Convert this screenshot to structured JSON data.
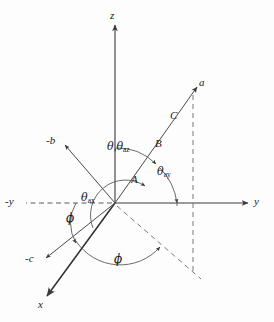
{
  "figure": {
    "type": "vector-direction-angle-diagram",
    "background_color": "#fdfdfd",
    "stroke_color": "#3a3a3a",
    "text_color": "#1a1a1a"
  },
  "axes": [
    {
      "name": "z-axis",
      "label": "z",
      "style": "solid",
      "direction": "up"
    },
    {
      "name": "y-axis",
      "label": "y",
      "style": "solid",
      "direction": "right"
    },
    {
      "name": "x-axis",
      "label": "x",
      "style": "solid",
      "direction": "down-left"
    },
    {
      "name": "negative-y-axis",
      "label": "-y",
      "style": "dashed",
      "direction": "left"
    }
  ],
  "vectors": [
    {
      "name": "vector-a",
      "label": "a",
      "style": "solid",
      "direction": "up-right"
    },
    {
      "name": "vector-negative-b",
      "label": "-b",
      "style": "solid",
      "direction": "up-left"
    },
    {
      "name": "vector-negative-c",
      "label": "-c",
      "style": "solid",
      "direction": "down-left"
    }
  ],
  "segment_labels": [
    {
      "name": "segment-label-a",
      "label": "A"
    },
    {
      "name": "segment-label-b",
      "label": "B"
    },
    {
      "name": "segment-label-c",
      "label": "C"
    }
  ],
  "angles": [
    {
      "name": "angle-theta-theta-az",
      "label_main": "θ",
      "label_sep": ",",
      "label_second": "θ",
      "label_second_sub": "az",
      "between": "z-axis and vector-a"
    },
    {
      "name": "angle-theta-ay",
      "label_main": "θ",
      "label_sub": "ay",
      "between": "y-axis and vector-a"
    },
    {
      "name": "angle-theta-ax",
      "label_main": "θ",
      "label_sub": "ax",
      "between": "x-axis and vector-a"
    },
    {
      "name": "angle-phi-upper",
      "label_main": "ϕ",
      "between": "negative-y-axis and vector-negative-c"
    },
    {
      "name": "angle-phi-lower",
      "label_main": "ϕ",
      "between": "x-axis and projection-of-a"
    }
  ],
  "projection": {
    "name": "projection-of-a",
    "style": "dashed",
    "description": "dashed projection of vector a onto the xy-plane and vertical drop line"
  }
}
